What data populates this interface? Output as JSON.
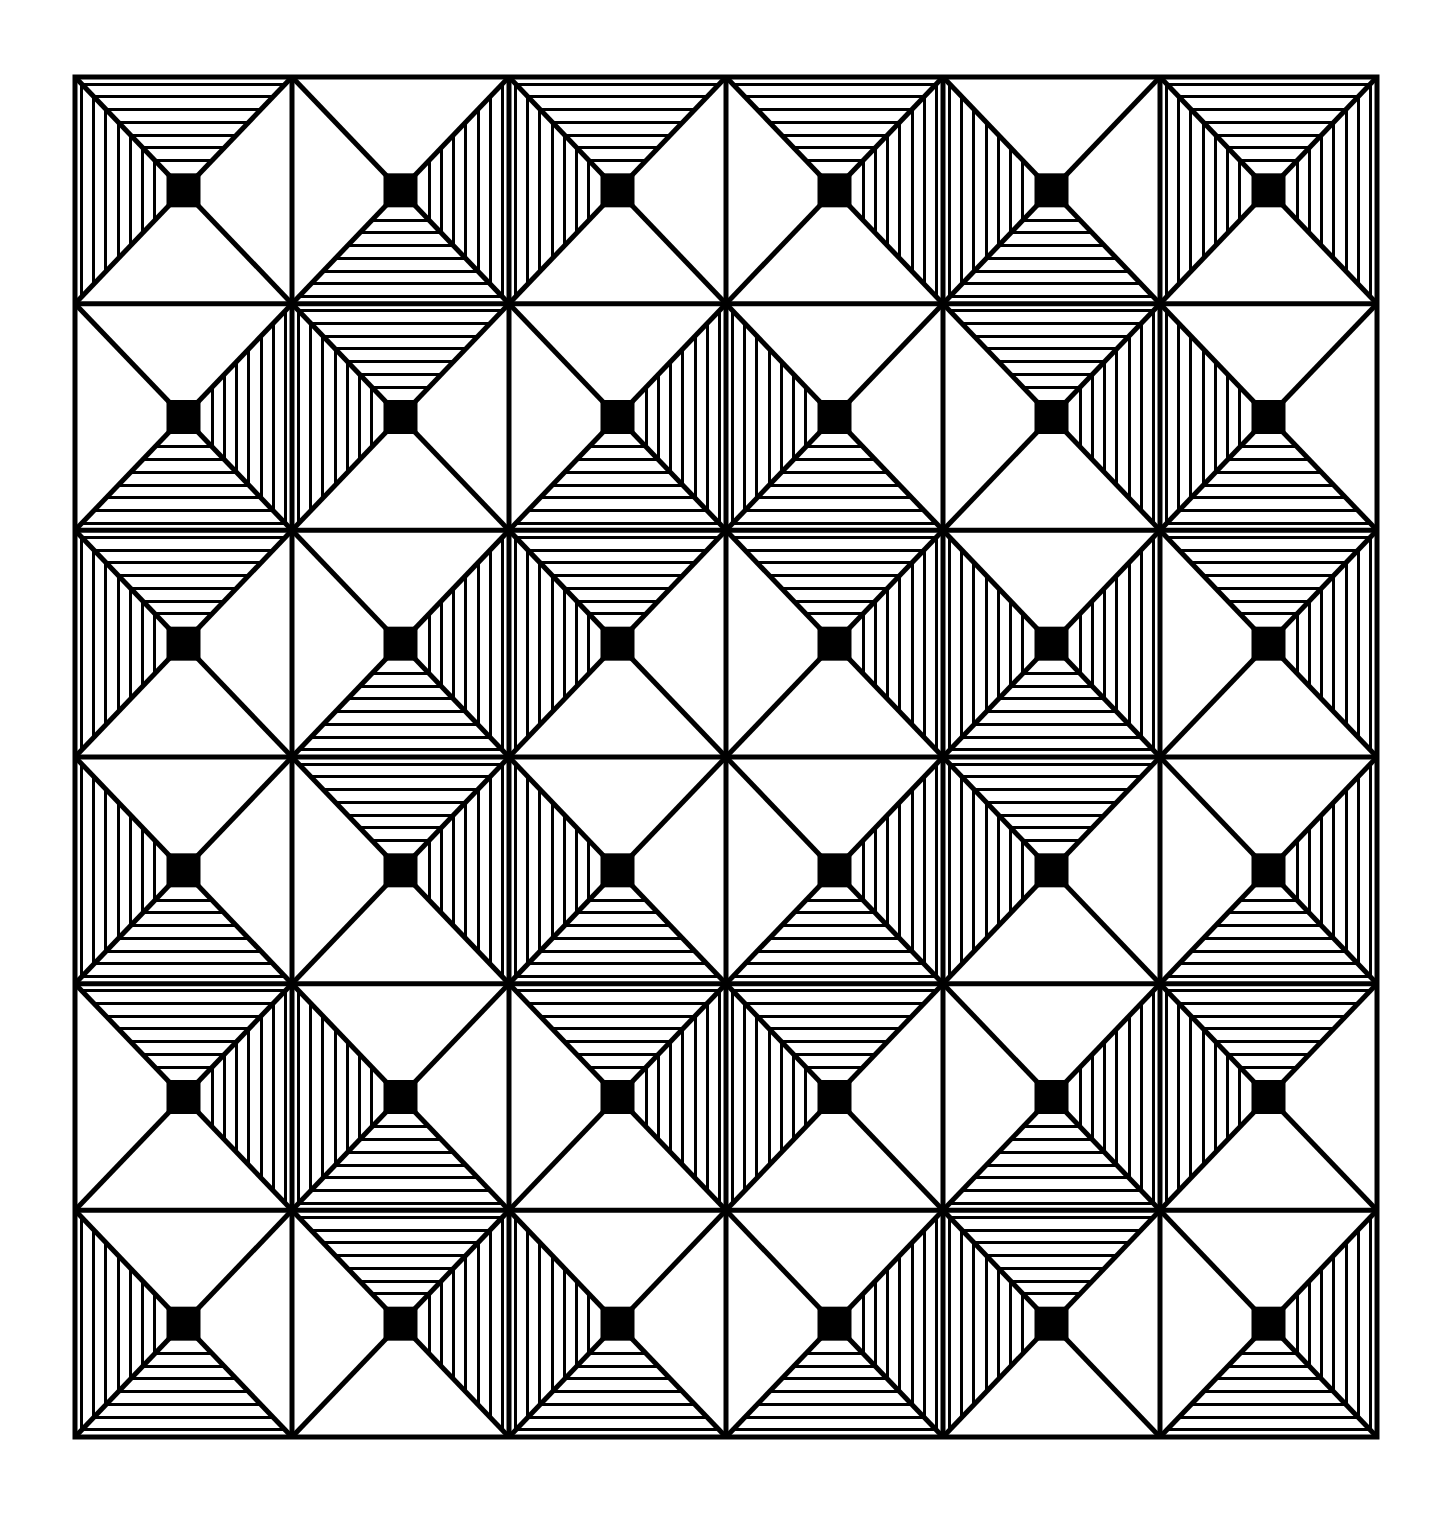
{
  "artwork": {
    "title": "Optical Geometric Tiling",
    "medium": "black-and-white line drawing",
    "background_color": "#ffffff",
    "ink_color": "#000000",
    "canvas": {
      "width": 1448,
      "height": 1535
    },
    "frame": {
      "x": 75,
      "y": 77,
      "width": 1302,
      "height": 1360,
      "border_width": 5
    },
    "grid": {
      "rows": 6,
      "cols": 6,
      "cell_width": 217,
      "cell_height": 226.667,
      "diagonals": true,
      "diagonal_stroke": 5,
      "grid_line_stroke": 5
    },
    "motif": {
      "description": "Each square cell is split by its two diagonals into four triangles (top, right, bottom, left). Each triangle is either plain white or filled with thin lines parallel to the cell edge. A solid black square sits at the cell centre.",
      "center_square_size": 34,
      "stripe_count": 7,
      "stripe_stroke": 3,
      "triangle_states": [
        "plain",
        "striped"
      ]
    },
    "legend": {
      "plain_label": "plain",
      "striped_label": "striped",
      "black_square_label": "black-center-square"
    }
  },
  "chart_data": {
    "type": "heatmap",
    "xlabel": "column",
    "ylabel": "row",
    "categories_x": [
      "1",
      "2",
      "3",
      "4",
      "5",
      "6"
    ],
    "categories_y": [
      "1",
      "2",
      "3",
      "4",
      "5",
      "6"
    ],
    "encoding": "each cell lists which of its four triangles (top,right,bottom,left) are striped (1) vs plain (0)",
    "cells": [
      [
        {
          "row": 1,
          "col": 1,
          "top": 1,
          "right": 0,
          "bottom": 0,
          "left": 1
        },
        {
          "row": 1,
          "col": 2,
          "top": 0,
          "right": 1,
          "bottom": 1,
          "left": 0
        },
        {
          "row": 1,
          "col": 3,
          "top": 1,
          "right": 0,
          "bottom": 0,
          "left": 1
        },
        {
          "row": 1,
          "col": 4,
          "top": 1,
          "right": 1,
          "bottom": 0,
          "left": 0
        },
        {
          "row": 1,
          "col": 5,
          "top": 0,
          "right": 0,
          "bottom": 1,
          "left": 1
        },
        {
          "row": 1,
          "col": 6,
          "top": 1,
          "right": 1,
          "bottom": 0,
          "left": 1
        }
      ],
      [
        {
          "row": 2,
          "col": 1,
          "top": 0,
          "right": 1,
          "bottom": 1,
          "left": 0
        },
        {
          "row": 2,
          "col": 2,
          "top": 1,
          "right": 0,
          "bottom": 0,
          "left": 1
        },
        {
          "row": 2,
          "col": 3,
          "top": 0,
          "right": 1,
          "bottom": 1,
          "left": 0
        },
        {
          "row": 2,
          "col": 4,
          "top": 0,
          "right": 0,
          "bottom": 1,
          "left": 1
        },
        {
          "row": 2,
          "col": 5,
          "top": 1,
          "right": 1,
          "bottom": 0,
          "left": 0
        },
        {
          "row": 2,
          "col": 6,
          "top": 0,
          "right": 0,
          "bottom": 1,
          "left": 1
        }
      ],
      [
        {
          "row": 3,
          "col": 1,
          "top": 1,
          "right": 0,
          "bottom": 0,
          "left": 1
        },
        {
          "row": 3,
          "col": 2,
          "top": 0,
          "right": 1,
          "bottom": 1,
          "left": 0
        },
        {
          "row": 3,
          "col": 3,
          "top": 1,
          "right": 0,
          "bottom": 0,
          "left": 1
        },
        {
          "row": 3,
          "col": 4,
          "top": 1,
          "right": 1,
          "bottom": 0,
          "left": 0
        },
        {
          "row": 3,
          "col": 5,
          "top": 0,
          "right": 1,
          "bottom": 1,
          "left": 1
        },
        {
          "row": 3,
          "col": 6,
          "top": 1,
          "right": 1,
          "bottom": 0,
          "left": 0
        }
      ],
      [
        {
          "row": 4,
          "col": 1,
          "top": 0,
          "right": 0,
          "bottom": 1,
          "left": 1
        },
        {
          "row": 4,
          "col": 2,
          "top": 1,
          "right": 1,
          "bottom": 0,
          "left": 0
        },
        {
          "row": 4,
          "col": 3,
          "top": 0,
          "right": 0,
          "bottom": 1,
          "left": 1
        },
        {
          "row": 4,
          "col": 4,
          "top": 0,
          "right": 1,
          "bottom": 1,
          "left": 0
        },
        {
          "row": 4,
          "col": 5,
          "top": 1,
          "right": 0,
          "bottom": 0,
          "left": 1
        },
        {
          "row": 4,
          "col": 6,
          "top": 0,
          "right": 1,
          "bottom": 1,
          "left": 0
        }
      ],
      [
        {
          "row": 5,
          "col": 1,
          "top": 1,
          "right": 1,
          "bottom": 0,
          "left": 0
        },
        {
          "row": 5,
          "col": 2,
          "top": 0,
          "right": 0,
          "bottom": 1,
          "left": 1
        },
        {
          "row": 5,
          "col": 3,
          "top": 1,
          "right": 1,
          "bottom": 0,
          "left": 0
        },
        {
          "row": 5,
          "col": 4,
          "top": 1,
          "right": 0,
          "bottom": 0,
          "left": 1
        },
        {
          "row": 5,
          "col": 5,
          "top": 0,
          "right": 1,
          "bottom": 1,
          "left": 0
        },
        {
          "row": 5,
          "col": 6,
          "top": 1,
          "right": 0,
          "bottom": 0,
          "left": 1
        }
      ],
      [
        {
          "row": 6,
          "col": 1,
          "top": 0,
          "right": 0,
          "bottom": 1,
          "left": 1
        },
        {
          "row": 6,
          "col": 2,
          "top": 1,
          "right": 1,
          "bottom": 0,
          "left": 0
        },
        {
          "row": 6,
          "col": 3,
          "top": 0,
          "right": 0,
          "bottom": 1,
          "left": 1
        },
        {
          "row": 6,
          "col": 4,
          "top": 0,
          "right": 1,
          "bottom": 1,
          "left": 0
        },
        {
          "row": 6,
          "col": 5,
          "top": 1,
          "right": 0,
          "bottom": 0,
          "left": 1
        },
        {
          "row": 6,
          "col": 6,
          "top": 0,
          "right": 1,
          "bottom": 1,
          "left": 0
        }
      ]
    ]
  }
}
